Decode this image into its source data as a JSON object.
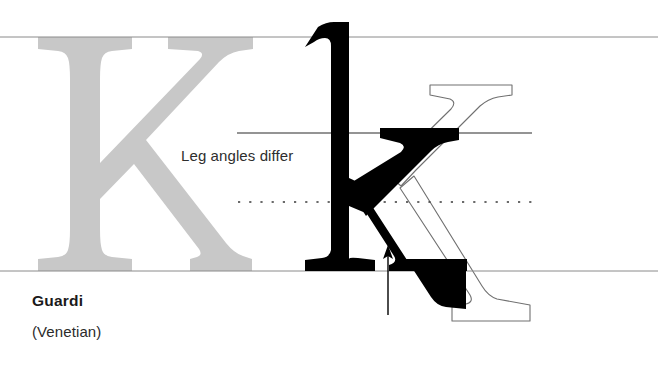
{
  "figure": {
    "kind": "typography-letterform-comparison",
    "background_color": "#ffffff",
    "width": 658,
    "height": 367
  },
  "caption": {
    "typeface_name": "Guardi",
    "classification": "(Venetian)"
  },
  "annotation": {
    "text": "Leg angles differ",
    "color": "#2e2e2e"
  },
  "guides": {
    "cap_height_line": {
      "name": "cap-height-line",
      "y": 37,
      "x1": 0,
      "x2": 658,
      "style": "solid",
      "color": "#8a8a8a"
    },
    "x_height_line": {
      "name": "x-height-line",
      "y": 133,
      "x1": 237,
      "x2": 532,
      "style": "solid",
      "color": "#2b2b2b"
    },
    "mid_dotted_line": {
      "name": "mid-dotted-line",
      "y": 202,
      "x1": 238,
      "x2": 532,
      "style": "dotted",
      "color": "#3a3a3a"
    },
    "baseline": {
      "name": "baseline",
      "y": 271,
      "x1": 0,
      "x2": 658,
      "style": "solid",
      "color": "#8a8a8a"
    }
  },
  "pointer": {
    "name": "leg-junction-arrow",
    "x": 388,
    "y_tail": 315,
    "y_head": 246,
    "color": "#000000"
  },
  "glyphs": {
    "background_capital_k": {
      "character": "K",
      "role": "background-capital",
      "fill": "#c8c8c8"
    },
    "solid_lowercase_k": {
      "character": "k",
      "role": "foreground-solid",
      "fill": "#000000"
    },
    "outline_lowercase_k": {
      "character": "k",
      "role": "comparison-outline",
      "fill": "none",
      "stroke": "#707070"
    }
  }
}
